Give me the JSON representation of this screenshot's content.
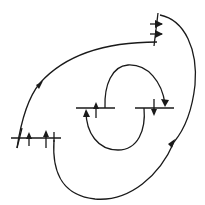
{
  "diagram": {
    "type": "line-field-orbit-diagram",
    "stroke_color": "#1a1a1a",
    "background": "#ffffff",
    "paths": {
      "outer_upper": "M 17 148 C 22 115, 30 95, 40 83 C 65 55, 105 42, 157 42",
      "outer_right": "M 160 15 C 185 20, 198 50, 195 85 C 192 112, 184 130, 174 142",
      "outer_bottom": "M 54 140 C 52 170, 60 195, 95 199 C 130 202, 160 175, 174 142",
      "inner_top": "M 105 108 C 104 85, 112 66, 128 65 C 148 64, 162 82, 165 104",
      "inner_bottom": "M 144 108 C 146 130, 138 150, 118 150 C 98 150, 86 133, 86 111"
    },
    "segments": [
      {
        "name": "top-right-vertical",
        "x1": 154,
        "y1": 46,
        "x2": 158,
        "y2": 13
      },
      {
        "name": "top-right-tick-1",
        "x1": 150,
        "y1": 24,
        "x2": 162,
        "y2": 24
      },
      {
        "name": "top-right-tick-2",
        "x1": 150,
        "y1": 34,
        "x2": 162,
        "y2": 34
      },
      {
        "name": "left-horizontal",
        "x1": 11,
        "y1": 138,
        "x2": 61,
        "y2": 138
      },
      {
        "name": "left-slant",
        "x1": 17,
        "y1": 148,
        "x2": 22,
        "y2": 128
      },
      {
        "name": "left-arrow-1-stem",
        "x1": 29,
        "y1": 146,
        "x2": 29,
        "y2": 134
      },
      {
        "name": "left-arrow-2-stem",
        "x1": 46,
        "y1": 148,
        "x2": 46,
        "y2": 132
      },
      {
        "name": "left-tick",
        "x1": 54,
        "y1": 132,
        "x2": 54,
        "y2": 142
      },
      {
        "name": "center-left-horizontal",
        "x1": 76,
        "y1": 108,
        "x2": 115,
        "y2": 108
      },
      {
        "name": "center-right-horizontal",
        "x1": 135,
        "y1": 108,
        "x2": 174,
        "y2": 108
      },
      {
        "name": "center-left-up-stem",
        "x1": 96,
        "y1": 118,
        "x2": 96,
        "y2": 104
      },
      {
        "name": "center-right-down-stem",
        "x1": 154,
        "y1": 99,
        "x2": 154,
        "y2": 113
      }
    ],
    "arrowheads": [
      {
        "name": "top-right-arrow-1",
        "points": "163,24 155,20 155,28"
      },
      {
        "name": "top-right-arrow-2",
        "points": "163,34 155,30 155,38"
      },
      {
        "name": "outer-upper-arrow",
        "points": "43,81 36,85 39,89"
      },
      {
        "name": "outer-bottom-arrow",
        "points": "175,139 168,144 172,148"
      },
      {
        "name": "left-arrow-1",
        "points": "29,132 26,139 32,139"
      },
      {
        "name": "left-arrow-2",
        "points": "46,130 43,137 49,137"
      },
      {
        "name": "center-left-up-arrow",
        "points": "96,102 93,109 99,109"
      },
      {
        "name": "center-right-down-arrow",
        "points": "154,116 151,109 157,109"
      },
      {
        "name": "inner-top-arrow",
        "points": "165,107 161,99 169,100"
      },
      {
        "name": "inner-bottom-arrow",
        "points": "86,109 83,117 90,117"
      }
    ]
  }
}
